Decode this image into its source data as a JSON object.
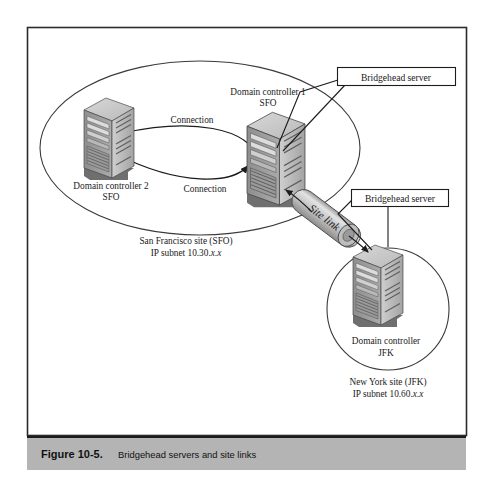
{
  "figure": {
    "caption_number": "Figure 10-5.",
    "caption_text": "Bridgehead servers and site links",
    "caption_bar_color": "#b4b4b4",
    "frame_border_color": "#2b2b2b",
    "background_color": "#ffffff"
  },
  "callouts": [
    {
      "id": "callout-top",
      "label": "Bridgehead server"
    },
    {
      "id": "callout-bottom",
      "label": "Bridgehead server"
    }
  ],
  "sites": {
    "san_francisco": {
      "shape": "ellipse",
      "name_line1": "San Francisco site (SFO)",
      "name_line2_prefix": "IP subnet 10.30.",
      "name_line2_italic": "x.x",
      "servers": [
        {
          "id": "domain-controller-2",
          "label_line1": "Domain controller 2",
          "label_line2": "SFO"
        },
        {
          "id": "domain-controller-1",
          "label_line1": "Domain controller 1",
          "label_line2": "SFO"
        }
      ],
      "connections": [
        {
          "id": "connection-top",
          "label": "Connection"
        },
        {
          "id": "connection-bottom",
          "label": "Connection"
        }
      ]
    },
    "new_york": {
      "shape": "circle",
      "name_line1": "New York site (JFK)",
      "name_line2_prefix": "IP subnet 10.60.",
      "name_line2_italic": "x.x",
      "servers": [
        {
          "id": "domain-controller-jfk",
          "label_line1": "Domain controller",
          "label_line2": "JFK"
        }
      ]
    }
  },
  "site_link": {
    "id": "site-link",
    "label": "Site link",
    "shape": "cylinder"
  }
}
